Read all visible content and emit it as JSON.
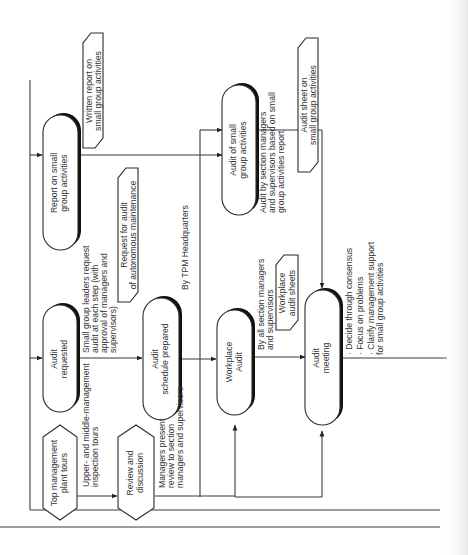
{
  "diagram": {
    "title": "",
    "orientation": "rotated-90-ccw",
    "colors": {
      "line": "#3a3a3a",
      "box_fill": "#ffffff",
      "text": "#333333",
      "shadow": "#111111"
    },
    "nodes": {
      "top_mgmt": {
        "shape": "hexagon",
        "lines": [
          "Top management",
          "plant tours"
        ]
      },
      "review": {
        "shape": "hexagon",
        "lines": [
          "Review and",
          "discussion"
        ]
      },
      "audit_requested": {
        "shape": "terminal",
        "lines": [
          "Audit",
          "requested"
        ]
      },
      "audit_schedule": {
        "shape": "terminal",
        "lines": [
          "Audit",
          "schedule prepared"
        ]
      },
      "workplace_audit": {
        "shape": "terminal",
        "lines": [
          "Workplace",
          "Audit"
        ]
      },
      "audit_meeting": {
        "shape": "terminal",
        "lines": [
          "Audit",
          "meeting"
        ]
      },
      "report_small": {
        "shape": "terminal",
        "lines": [
          "Report on small",
          "group activities"
        ]
      },
      "audit_small": {
        "shape": "terminal",
        "lines": [
          "Audit of small",
          "group activities"
        ]
      }
    },
    "documents": {
      "written_report": {
        "lines": [
          "Written report on",
          "small group activities"
        ]
      },
      "request_audit": {
        "lines": [
          "Request for audit",
          "of autonomous maintenance"
        ]
      },
      "workplace_sheets": {
        "lines": [
          "Workplace",
          "audit sheets"
        ]
      },
      "audit_sheet": {
        "lines": [
          "Audit sheet on",
          "small group activities"
        ]
      }
    },
    "annotations": {
      "inspection_tours": [
        "Upper- and middle-management",
        "inspection tours"
      ],
      "managers_present": [
        "Managers present",
        "review to section",
        "managers and supervisors"
      ],
      "small_group_leaders": [
        "Small group leaders request",
        "audit at each step (with",
        "approval of managers and",
        "supervisors)"
      ],
      "by_tpm": [
        "By TPM Headquarters"
      ],
      "by_all_section": [
        "By all section managers",
        "and supervisors"
      ],
      "audit_by_section": [
        "Audit by section managers",
        "and supervisors based on small",
        "group activities report"
      ],
      "meeting_bullets": [
        "· Decide through consensus",
        "· Focus on problems",
        "· Clarify management support",
        "  for small group activities"
      ]
    }
  }
}
